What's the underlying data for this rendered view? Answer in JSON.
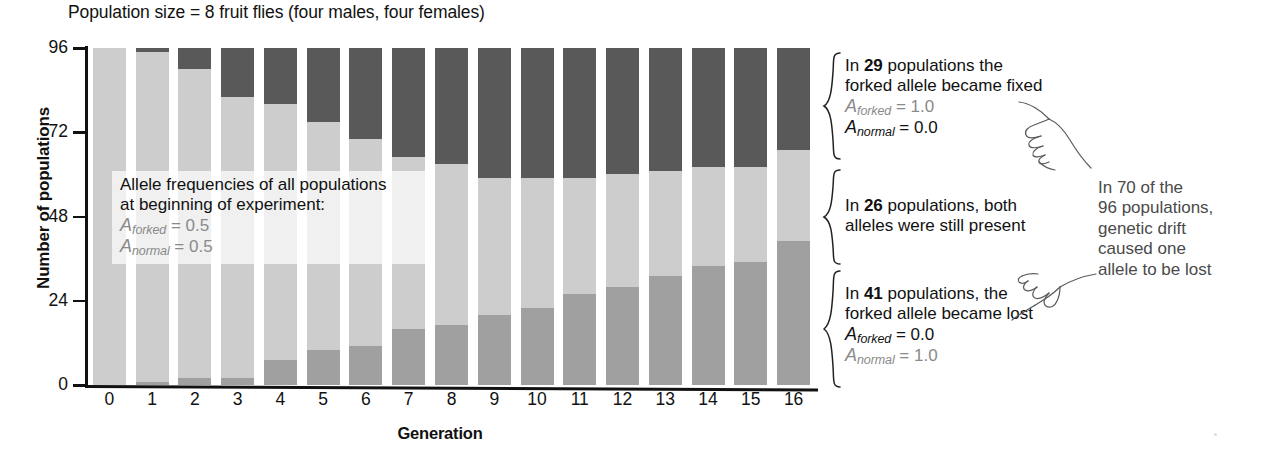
{
  "chart_data": {
    "type": "bar",
    "subtype": "stacked-bar",
    "title": "Population size = 8 fruit flies (four males, four females)",
    "xlabel": "Generation",
    "ylabel": "Number of populations",
    "ylim": [
      0,
      96
    ],
    "ytick_labels": [
      "0",
      "24",
      "48",
      "72",
      "96"
    ],
    "yticks": [
      0,
      24,
      48,
      72,
      96
    ],
    "grid": false,
    "legend_position": "right-braces",
    "categories": [
      "0",
      "1",
      "2",
      "3",
      "4",
      "5",
      "6",
      "7",
      "8",
      "9",
      "10",
      "11",
      "12",
      "13",
      "14",
      "15",
      "16"
    ],
    "series": [
      {
        "name": "forked allele became lost",
        "color": "#a0a0a0",
        "stack_order": 1,
        "values": [
          0,
          1,
          2,
          2,
          7,
          10,
          11,
          16,
          17,
          20,
          22,
          26,
          28,
          31,
          34,
          35,
          41
        ]
      },
      {
        "name": "both alleles still present",
        "color": "#cdcdcd",
        "stack_order": 2,
        "values": [
          96,
          94,
          88,
          80,
          73,
          65,
          59,
          49,
          46,
          39,
          37,
          33,
          32,
          30,
          28,
          27,
          26
        ]
      },
      {
        "name": "forked allele became fixed",
        "color": "#595959",
        "stack_order": 3,
        "values": [
          0,
          1,
          6,
          14,
          16,
          21,
          26,
          31,
          33,
          37,
          37,
          37,
          36,
          35,
          34,
          34,
          29
        ]
      }
    ],
    "totals": [
      96,
      96,
      96,
      96,
      96,
      96,
      96,
      96,
      96,
      96,
      96,
      96,
      96,
      96,
      96,
      96,
      96
    ]
  },
  "colors": {
    "fixed": "#595959",
    "both": "#cdcdcd",
    "lost": "#a0a0a0",
    "axis": "#111111",
    "muted_text": "#8a8a8a",
    "drift_text": "#4a4a4a"
  },
  "inset_note": {
    "line1": "Allele frequencies of all populations",
    "line2": "at beginning of experiment:",
    "a_forked_label": "A",
    "a_forked_sub": "forked",
    "a_forked_eq": " = 0.5",
    "a_normal_label": "A",
    "a_normal_sub": "normal",
    "a_normal_eq": " = 0.5"
  },
  "annotations": {
    "fixed": {
      "line1_pre": "In ",
      "line1_num": "29",
      "line1_post": " populations the",
      "line2": "forked allele became fixed",
      "a_forked_label": "A",
      "a_forked_sub": "forked",
      "a_forked_eq": " = 1.0",
      "a_normal_label": "A",
      "a_normal_sub": "normal",
      "a_normal_eq": " = 0.0"
    },
    "both": {
      "line1_pre": "In ",
      "line1_num": "26",
      "line1_post": " populations, both",
      "line2": "alleles were still present"
    },
    "lost": {
      "line1_pre": "In ",
      "line1_num": "41",
      "line1_post": " populations, the",
      "line2": "forked allele became lost",
      "a_forked_label": "A",
      "a_forked_sub": "forked",
      "a_forked_eq": " = 0.0",
      "a_normal_label": "A",
      "a_normal_sub": "normal",
      "a_normal_eq": " = 1.0"
    },
    "drift": {
      "line1": "In 70 of the",
      "line2": "96 populations,",
      "line3": "genetic drift",
      "line4": "caused one",
      "line5": "allele to be lost"
    }
  },
  "icons": {
    "hand_upper": "pointing-hand-icon",
    "hand_lower": "pointing-hand-icon"
  }
}
